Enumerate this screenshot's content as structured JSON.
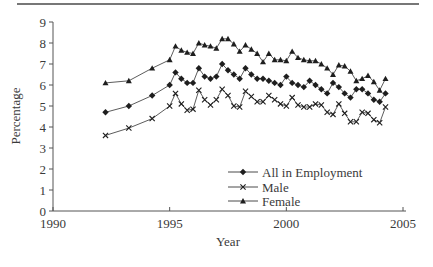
{
  "chart_data": {
    "type": "line",
    "title": "",
    "xlabel": "Year",
    "ylabel": "Percentage",
    "xlim": [
      1990,
      2005
    ],
    "ylim": [
      0,
      9
    ],
    "xticks": [
      1990,
      1995,
      2000,
      2005
    ],
    "yticks": [
      0,
      1,
      2,
      3,
      4,
      5,
      6,
      7,
      8,
      9
    ],
    "grid": false,
    "legend_position": "lower right inside plot",
    "x": [
      1992.25,
      1993.25,
      1994.25,
      1995.0,
      1995.25,
      1995.5,
      1995.75,
      1996.0,
      1996.25,
      1996.5,
      1996.75,
      1997.0,
      1997.25,
      1997.5,
      1997.75,
      1998.0,
      1998.25,
      1998.5,
      1998.75,
      1999.0,
      1999.25,
      1999.5,
      1999.75,
      2000.0,
      2000.25,
      2000.5,
      2000.75,
      2001.0,
      2001.25,
      2001.5,
      2001.75,
      2002.0,
      2002.25,
      2002.5,
      2002.75,
      2003.0,
      2003.25,
      2003.5,
      2003.75,
      2004.0,
      2004.25
    ],
    "series": [
      {
        "name": "All in Employment",
        "marker": "diamond",
        "values": [
          4.7,
          5.0,
          5.5,
          6.0,
          6.6,
          6.3,
          6.1,
          6.1,
          6.8,
          6.4,
          6.3,
          6.4,
          7.0,
          6.7,
          6.5,
          6.3,
          6.8,
          6.5,
          6.3,
          6.3,
          6.2,
          6.1,
          6.0,
          6.4,
          6.1,
          6.0,
          5.9,
          6.2,
          6.0,
          5.8,
          5.6,
          6.1,
          5.9,
          5.6,
          5.4,
          5.8,
          5.8,
          5.6,
          5.3,
          5.2,
          5.6
        ]
      },
      {
        "name": "Male",
        "marker": "x",
        "values": [
          3.6,
          3.95,
          4.4,
          5.0,
          5.6,
          5.1,
          4.8,
          4.85,
          5.75,
          5.3,
          5.05,
          5.3,
          5.8,
          5.5,
          5.0,
          4.95,
          5.7,
          5.45,
          5.2,
          5.2,
          5.5,
          5.3,
          5.1,
          5.0,
          5.4,
          5.05,
          4.95,
          4.95,
          5.1,
          5.05,
          4.7,
          4.6,
          5.1,
          4.65,
          4.25,
          4.25,
          4.7,
          4.65,
          4.35,
          4.2,
          4.95
        ]
      },
      {
        "name": "Female",
        "marker": "triangle",
        "values": [
          6.1,
          6.2,
          6.8,
          7.2,
          7.85,
          7.65,
          7.55,
          7.5,
          8.0,
          7.9,
          7.85,
          7.75,
          8.2,
          8.2,
          7.95,
          7.6,
          7.9,
          7.7,
          7.5,
          7.1,
          7.5,
          7.2,
          7.2,
          7.15,
          7.6,
          7.3,
          7.2,
          7.15,
          7.15,
          7.0,
          6.8,
          6.5,
          6.95,
          6.9,
          6.65,
          6.2,
          6.3,
          6.45,
          6.15,
          5.75,
          6.3
        ]
      }
    ]
  },
  "axes": {
    "xlabel": "Year",
    "ylabel": "Percentage"
  },
  "legend": {
    "items": [
      {
        "label": "All in Employment",
        "marker": "diamond"
      },
      {
        "label": "Male",
        "marker": "x"
      },
      {
        "label": "Female",
        "marker": "triangle"
      }
    ]
  },
  "colors": {
    "line": "#4a4a4a",
    "marker": "#1e1e1e",
    "axis": "#555555",
    "text": "#3a3a3a"
  }
}
